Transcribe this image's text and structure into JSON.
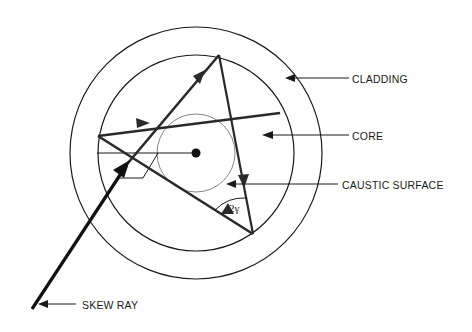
{
  "diagram": {
    "labels": {
      "cladding": "CLADDING",
      "core": "CORE",
      "caustic_surface": "CAUSTIC SURFACE",
      "skew_ray": "SKEW RAY",
      "angle": "2γ"
    },
    "geometry": {
      "center": [
        196,
        153
      ],
      "outer_radius": 126,
      "core_radius": 98,
      "caustic_radius": 39
    },
    "colors": {
      "line": "#1a1a1a",
      "ray": "#2a2a2a",
      "caustic": "#555555",
      "background": "#ffffff"
    }
  }
}
